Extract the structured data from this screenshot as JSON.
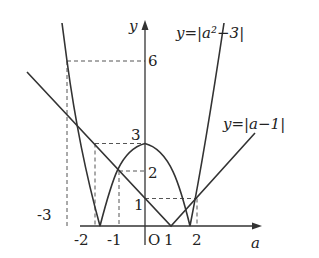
{
  "diagram": {
    "axes": {
      "x_label": "a",
      "y_label": "y",
      "origin_label": "O"
    },
    "x_ticks": [
      "-3",
      "-2",
      "-1",
      "1",
      "2"
    ],
    "y_ticks": [
      "1",
      "2",
      "3",
      "6"
    ],
    "curves": [
      {
        "name": "abs-quadratic",
        "label": "y=|a²−3|"
      },
      {
        "name": "abs-linear",
        "label": "y=|a−1|"
      }
    ],
    "colors": {
      "ink": "#333333",
      "background": "#ffffff"
    }
  }
}
